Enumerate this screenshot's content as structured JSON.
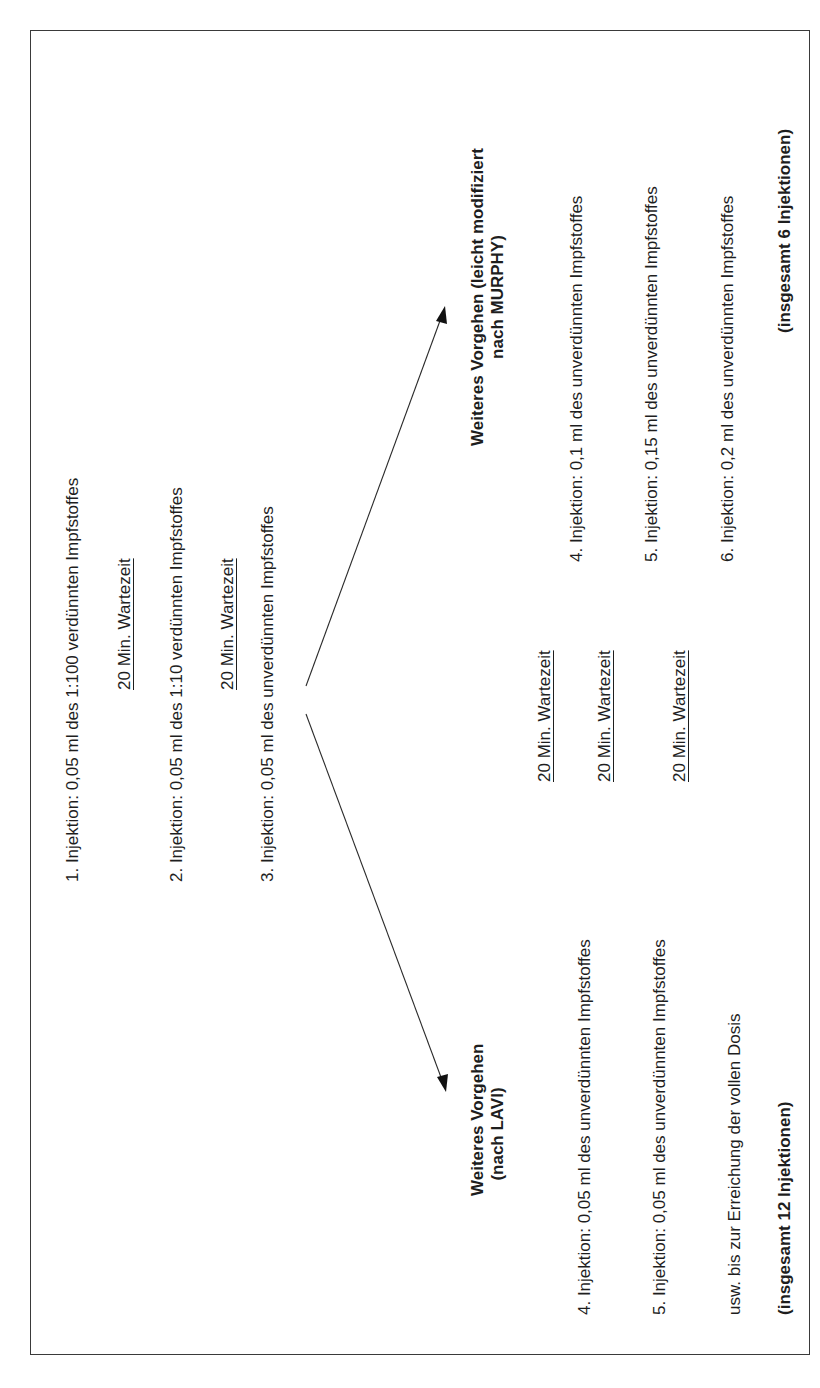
{
  "initial_steps": [
    {
      "label": "1. Injektion: 0,05 ml des 1:100 verdünnten Impfstoffes"
    },
    {
      "label": "20 Min. Wartezeit"
    },
    {
      "label": "2. Injektion: 0,05 ml des 1:10 verdünnten Impfstoffes"
    },
    {
      "label": "20 Min. Wartezeit"
    },
    {
      "label": "3. Injektion: 0,05 ml des unverdünnten Impfstoffes"
    }
  ],
  "branch_murphy": {
    "title_line1": "Weiteres Vorgehen (leicht modifiziert",
    "title_line2": "nach MURPHY)",
    "waits": [
      "20 Min. Wartezeit",
      "20 Min. Wartezeit",
      "20 Min. Wartezeit"
    ],
    "steps": [
      "4. Injektion: 0,1 ml des unverdünnten Impfstoffes",
      "5. Injektion: 0,15 ml des unverdünnten Impfstoffes",
      "6. Injektion: 0,2 ml des unverdünnten Impfstoffes"
    ],
    "total": "(insgesamt 6 Injektionen)"
  },
  "branch_lavi": {
    "title_line1": "Weiteres Vorgehen",
    "title_line2": "(nach LAVI)",
    "steps": [
      "4. Injektion: 0,05 ml des unverdünnten Impfstoffes",
      "5. Injektion: 0,05 ml des unverdünnten Impfstoffes",
      "usw. bis zur Erreichung der vollen Dosis"
    ],
    "total": "(insgesamt 12 Injektionen)"
  },
  "colors": {
    "text": "#1e1e1e",
    "border": "#3a3a3a",
    "line": "#2a2a2a"
  }
}
